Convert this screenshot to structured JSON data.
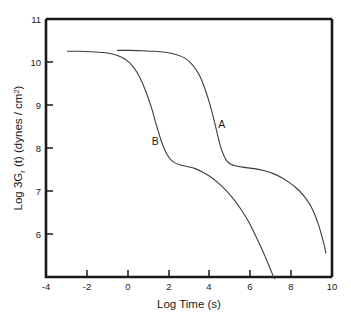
{
  "chart_data": {
    "type": "line",
    "title": "",
    "xlabel": "Log Time (s)",
    "ylabel": "Log 3G",
    "ylabel_sub": "r",
    "ylabel_rest": " (t) (dynes / cm",
    "ylabel_sup": "2",
    "ylabel_close": ")",
    "ylabel_full": "Log 3Gr (t) (dynes / cm2)",
    "xlim": [
      -4,
      10
    ],
    "ylim": [
      5,
      11
    ],
    "xticks": [
      -4,
      -2,
      0,
      2,
      4,
      6,
      8,
      10
    ],
    "yticks": [
      6,
      7,
      8,
      9,
      10,
      11
    ],
    "xtick_labels": [
      "-4",
      "-2",
      "0",
      "2",
      "4",
      "6",
      "8",
      "10"
    ],
    "ytick_labels": [
      "6",
      "7",
      "8",
      "9",
      "10",
      "11"
    ],
    "grid": false,
    "legend": "inline-annotations",
    "annotations": [
      {
        "text": "A",
        "x": 4.6,
        "y": 8.47
      },
      {
        "text": "B",
        "x": 1.35,
        "y": 8.07
      }
    ],
    "series": [
      {
        "name": "A",
        "label": "A",
        "color": "#3b3b44",
        "points": [
          [
            -0.5,
            10.27
          ],
          [
            0.1,
            10.27
          ],
          [
            0.7,
            10.26
          ],
          [
            1.3,
            10.25
          ],
          [
            1.9,
            10.22
          ],
          [
            2.4,
            10.17
          ],
          [
            2.8,
            10.09
          ],
          [
            3.1,
            9.97
          ],
          [
            3.35,
            9.82
          ],
          [
            3.55,
            9.65
          ],
          [
            3.75,
            9.42
          ],
          [
            3.95,
            9.13
          ],
          [
            4.1,
            8.88
          ],
          [
            4.25,
            8.6
          ],
          [
            4.4,
            8.3
          ],
          [
            4.55,
            8.02
          ],
          [
            4.7,
            7.83
          ],
          [
            4.85,
            7.7
          ],
          [
            5.05,
            7.62
          ],
          [
            5.3,
            7.58
          ],
          [
            5.7,
            7.55
          ],
          [
            6.2,
            7.52
          ],
          [
            6.7,
            7.47
          ],
          [
            7.1,
            7.41
          ],
          [
            7.5,
            7.32
          ],
          [
            7.9,
            7.2
          ],
          [
            8.25,
            7.07
          ],
          [
            8.6,
            6.9
          ],
          [
            8.9,
            6.7
          ],
          [
            9.15,
            6.46
          ],
          [
            9.35,
            6.2
          ],
          [
            9.5,
            5.95
          ],
          [
            9.62,
            5.74
          ],
          [
            9.7,
            5.56
          ]
        ]
      },
      {
        "name": "B",
        "label": "B",
        "color": "#3b3b44",
        "points": [
          [
            -2.95,
            10.25
          ],
          [
            -2.4,
            10.25
          ],
          [
            -1.8,
            10.24
          ],
          [
            -1.2,
            10.22
          ],
          [
            -0.7,
            10.18
          ],
          [
            -0.3,
            10.11
          ],
          [
            0.0,
            10.02
          ],
          [
            0.25,
            9.9
          ],
          [
            0.45,
            9.76
          ],
          [
            0.65,
            9.58
          ],
          [
            0.85,
            9.36
          ],
          [
            1.05,
            9.1
          ],
          [
            1.2,
            8.88
          ],
          [
            1.35,
            8.62
          ],
          [
            1.5,
            8.38
          ],
          [
            1.65,
            8.15
          ],
          [
            1.8,
            7.97
          ],
          [
            1.95,
            7.83
          ],
          [
            2.1,
            7.73
          ],
          [
            2.3,
            7.66
          ],
          [
            2.55,
            7.61
          ],
          [
            2.9,
            7.57
          ],
          [
            3.3,
            7.52
          ],
          [
            3.7,
            7.43
          ],
          [
            4.05,
            7.33
          ],
          [
            4.4,
            7.2
          ],
          [
            4.8,
            7.02
          ],
          [
            5.2,
            6.8
          ],
          [
            5.55,
            6.57
          ],
          [
            5.9,
            6.3
          ],
          [
            6.2,
            6.02
          ],
          [
            6.5,
            5.72
          ],
          [
            6.75,
            5.45
          ],
          [
            6.95,
            5.22
          ],
          [
            7.1,
            5.05
          ],
          [
            7.18,
            4.96
          ]
        ]
      }
    ]
  },
  "axes": {
    "geometry": {
      "left": 46,
      "right": 332,
      "top": 19,
      "bottom": 277
    }
  }
}
